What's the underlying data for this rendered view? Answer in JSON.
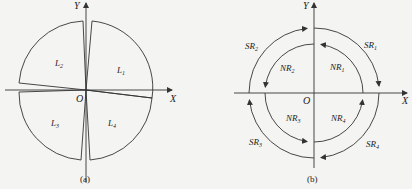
{
  "figure_a": {
    "caption": "(a)",
    "axis_x": "X",
    "axis_y": "Y",
    "origin": "O",
    "regions": [
      {
        "base": "L",
        "sub": "1"
      },
      {
        "base": "L",
        "sub": "2"
      },
      {
        "base": "L",
        "sub": "3"
      },
      {
        "base": "L",
        "sub": "4"
      }
    ]
  },
  "figure_b": {
    "caption": "(b)",
    "axis_x": "X",
    "axis_y": "Y",
    "origin": "O",
    "outer_labels": [
      {
        "base": "SR",
        "sub": "1"
      },
      {
        "base": "SR",
        "sub": "2"
      },
      {
        "base": "SR",
        "sub": "3"
      },
      {
        "base": "SR",
        "sub": "4"
      }
    ],
    "inner_labels": [
      {
        "base": "NR",
        "sub": "1"
      },
      {
        "base": "NR",
        "sub": "2"
      },
      {
        "base": "NR",
        "sub": "3"
      },
      {
        "base": "NR",
        "sub": "4"
      }
    ],
    "outer_direction": "clockwise",
    "inner_direction": "counterclockwise"
  },
  "colors": {
    "line": "#333333",
    "background": "#f4f4f2"
  }
}
